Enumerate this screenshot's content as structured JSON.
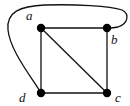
{
  "diagram": {
    "type": "graph",
    "nodes": [
      {
        "id": "a",
        "label": "a",
        "x": 41,
        "y": 28,
        "label_x": 26,
        "label_y": 20
      },
      {
        "id": "b",
        "label": "b",
        "x": 107,
        "y": 28,
        "label_x": 111,
        "label_y": 44
      },
      {
        "id": "c",
        "label": "c",
        "x": 107,
        "y": 93,
        "label_x": 115,
        "label_y": 102
      },
      {
        "id": "d",
        "label": "d",
        "x": 41,
        "y": 93,
        "label_x": 19,
        "label_y": 102
      }
    ],
    "edges": [
      {
        "from": "a",
        "to": "b",
        "shape": "straight"
      },
      {
        "from": "b",
        "to": "c",
        "shape": "straight"
      },
      {
        "from": "c",
        "to": "d",
        "shape": "straight"
      },
      {
        "from": "d",
        "to": "a",
        "shape": "straight"
      },
      {
        "from": "a",
        "to": "c",
        "shape": "straight"
      },
      {
        "from": "d",
        "to": "b",
        "shape": "curved-outer"
      }
    ],
    "colors": {
      "node": "#000000",
      "edge": "#111111",
      "background": "#ffffff"
    }
  }
}
